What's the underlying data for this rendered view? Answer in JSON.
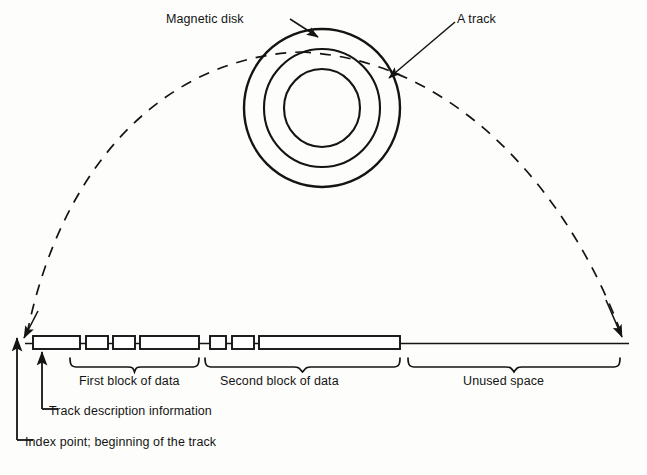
{
  "figure": {
    "type": "technical-diagram",
    "background_color": "#fdfdfb",
    "line_color": "#141414"
  },
  "disk": {
    "labels": {
      "magnetic_disk": "Magnetic disk",
      "a_track": "A track"
    },
    "center": {
      "x": 322,
      "y": 108
    },
    "rings": [
      {
        "name": "outer-edge",
        "rx": 78,
        "ry": 79
      },
      {
        "name": "track-outer",
        "rx": 58,
        "ry": 59
      },
      {
        "name": "track-inner",
        "rx": 38,
        "ry": 39
      }
    ]
  },
  "track_line": {
    "y": 343,
    "x_start": 25,
    "x_end": 629,
    "blocks": [
      {
        "name": "track-description",
        "x": 33,
        "width": 47
      },
      {
        "name": "first-block-seg-1",
        "x": 86,
        "width": 22
      },
      {
        "name": "first-block-seg-2",
        "x": 113,
        "width": 22
      },
      {
        "name": "first-block-seg-3",
        "x": 140,
        "width": 59
      },
      {
        "name": "second-block-seg-1",
        "x": 210,
        "width": 16
      },
      {
        "name": "second-block-seg-2",
        "x": 232,
        "width": 22
      },
      {
        "name": "second-block-seg-3",
        "x": 259,
        "width": 141
      }
    ]
  },
  "braces": [
    {
      "name": "first-block-brace",
      "label": "First block of data",
      "x_start": 70,
      "x_end": 199
    },
    {
      "name": "second-block-brace",
      "label": "Second block of data",
      "x_start": 205,
      "x_end": 400
    },
    {
      "name": "unused-space-brace",
      "label": "Unused space",
      "x_start": 408,
      "x_end": 620
    }
  ],
  "callouts": [
    {
      "name": "track-description-callout",
      "label": "Track description information",
      "arrow_x": 42,
      "arrow_top": 350,
      "elbow_y": 409
    },
    {
      "name": "index-point-callout",
      "label": "Index point; beginning of the track",
      "arrow_x": 17,
      "arrow_top": 336,
      "elbow_y": 440
    }
  ],
  "dashed_arc": {
    "name": "expansion-arc",
    "style": "dashed",
    "from": {
      "x": 25,
      "y": 336
    },
    "to": {
      "x": 620,
      "y": 336
    },
    "apex_y": 30
  }
}
